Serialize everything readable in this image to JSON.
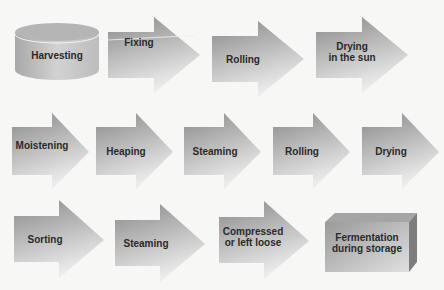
{
  "diagram": {
    "type": "process-flow",
    "start": {
      "label": "Harvesting",
      "shape": "cylinder"
    },
    "row1": [
      {
        "label": "Fixing"
      },
      {
        "label": "Rolling"
      },
      {
        "label": "Drying\nin the sun"
      }
    ],
    "row2": [
      {
        "label": "Moistening"
      },
      {
        "label": "Heaping"
      },
      {
        "label": "Steaming"
      },
      {
        "label": "Rolling"
      },
      {
        "label": "Drying"
      }
    ],
    "row3": [
      {
        "label": "Sorting"
      },
      {
        "label": "Steaming"
      },
      {
        "label": "Compressed\nor left loose"
      }
    ],
    "end": {
      "label": "Fermentation\nduring storage",
      "shape": "box"
    },
    "colors": {
      "shape_dark": "#8a8a8a",
      "shape_light": "#e8e8e8",
      "text": "#2a2a2a"
    }
  }
}
